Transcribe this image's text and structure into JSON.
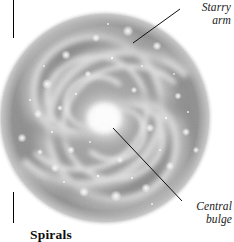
{
  "figure": {
    "name": "spiral-galaxy-diagram",
    "background_color": "#ffffff",
    "ink_color": "#000000"
  },
  "galaxy": {
    "subject": "face-on spiral galaxy",
    "center_x": 105,
    "center_y": 118,
    "disk_radius": 108,
    "disk_color_outer": "#8e8e8e",
    "disk_color_mid": "#a6a6a6",
    "arm_color": "#d8d8d8",
    "bulge_color": "#ffffff",
    "arm_count": 4,
    "winding": "counterclockwise"
  },
  "callouts": [
    {
      "id": "starry-arm",
      "line1": "Starry",
      "line2": "arm",
      "leader": {
        "x1": 180,
        "y1": 9,
        "x2": 133,
        "y2": 43
      }
    },
    {
      "id": "central-bulge",
      "line1": "Central",
      "line2": "bulge",
      "leader": {
        "x1": 182,
        "y1": 201,
        "x2": 113,
        "y2": 128
      }
    }
  ],
  "caption": {
    "text": "Spirals"
  },
  "crop_rules": [
    {
      "id": "top",
      "x": 13,
      "y": 0,
      "height": 38
    },
    {
      "id": "bottom",
      "x": 13,
      "y": 192,
      "height": 31
    }
  ]
}
